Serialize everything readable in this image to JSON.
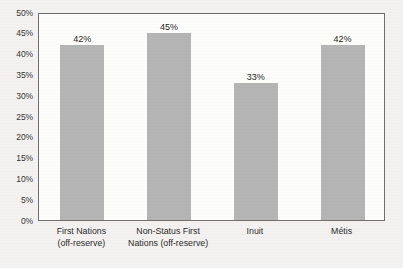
{
  "chart_data": {
    "type": "bar",
    "title": "",
    "xlabel": "",
    "ylabel": "",
    "ylim": [
      0,
      50
    ],
    "grid": false,
    "legend": false,
    "categories": [
      "First Nations (off-reserve)",
      "Non-Status First Nations (off-reserve)",
      "Inuit",
      "Métis"
    ],
    "category_lines": [
      [
        "First Nations",
        "(off-reserve)"
      ],
      [
        "Non-Status First",
        "Nations (off-reserve)"
      ],
      [
        "Inuit"
      ],
      [
        "Métis"
      ]
    ],
    "values": [
      42,
      45,
      33,
      42
    ],
    "value_labels": [
      "42%",
      "45%",
      "33%",
      "42%"
    ],
    "y_ticks": [
      50,
      45,
      40,
      35,
      30,
      25,
      20,
      15,
      10,
      5,
      0
    ],
    "y_tick_labels": [
      "50%",
      "45%",
      "40%",
      "35%",
      "30%",
      "25%",
      "20%",
      "15%",
      "10%",
      "5%",
      "0%"
    ],
    "colors": {
      "bar": "#b5b5b5",
      "plot_background": "#fdfdfc",
      "page_background": "#f3f2f0",
      "axis_line": "#6f6f6f",
      "text": "#2b2b2b"
    }
  }
}
